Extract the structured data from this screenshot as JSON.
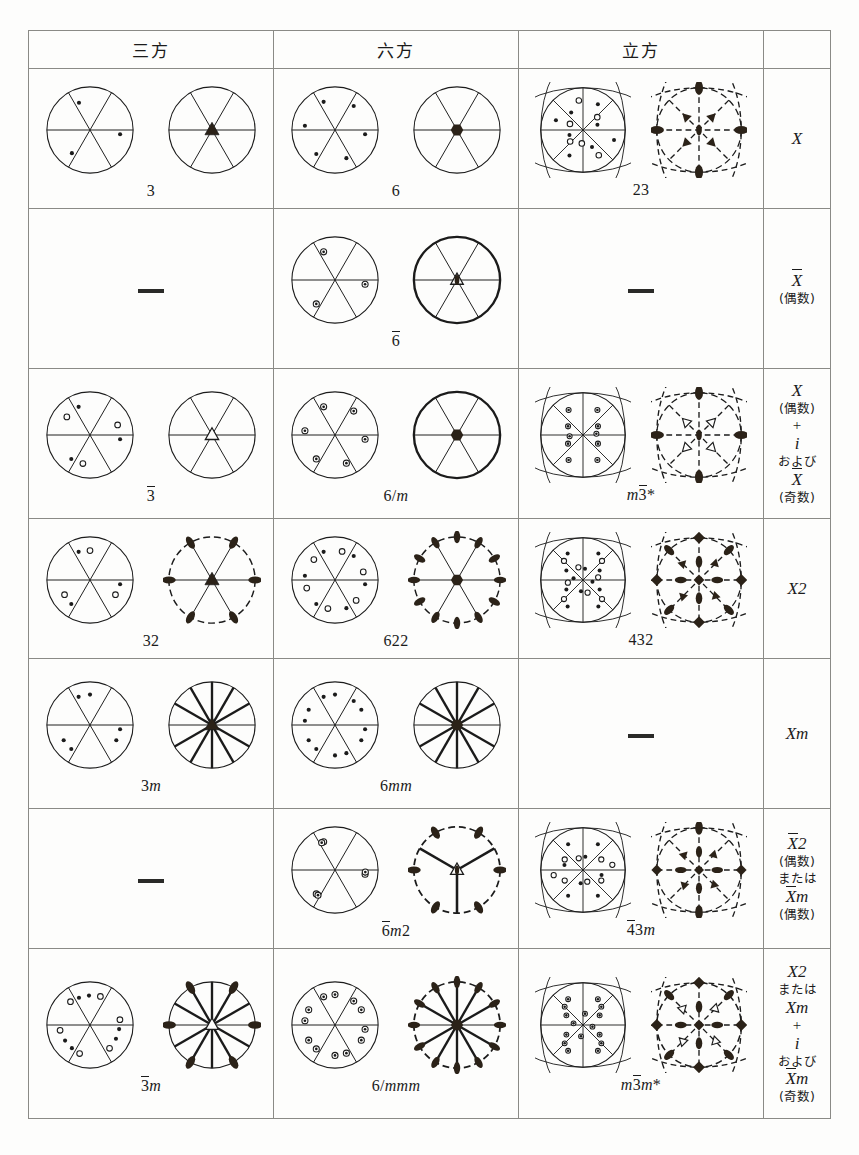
{
  "header": {
    "columns": [
      "三方",
      "六方",
      "立方",
      ""
    ],
    "column_names": [
      "trigonal",
      "hexagonal",
      "cubic",
      "general-symbol"
    ]
  },
  "rows": [
    {
      "id": "row-X",
      "trigonal": {
        "symbol": "3",
        "present": true
      },
      "hexagonal": {
        "symbol": "6",
        "present": true
      },
      "cubic": {
        "symbol": "23",
        "present": true
      },
      "label_lines": [
        {
          "text": "X",
          "style": "italic-cap"
        }
      ]
    },
    {
      "id": "row-Xbar-even",
      "trigonal": {
        "symbol": "",
        "present": false
      },
      "hexagonal": {
        "symbol": "6̄",
        "present": true
      },
      "cubic": {
        "symbol": "",
        "present": false
      },
      "label_lines": [
        {
          "text": "X",
          "style": "italic-cap-overline"
        },
        {
          "text": "(偶数)",
          "style": "jp"
        }
      ]
    },
    {
      "id": "row-X-even-plus-i",
      "trigonal": {
        "symbol": "3̄",
        "present": true
      },
      "hexagonal": {
        "symbol": "6/m",
        "present": true
      },
      "cubic": {
        "symbol": "m3̄*",
        "present": true
      },
      "label_lines": [
        {
          "text": "X",
          "style": "italic-cap"
        },
        {
          "text": "(偶数)",
          "style": "jp"
        },
        {
          "text": "+",
          "style": "op"
        },
        {
          "text": "i",
          "style": "italic"
        },
        {
          "text": "および",
          "style": "jp"
        },
        {
          "text": "X",
          "style": "italic-cap-overline"
        },
        {
          "text": "(奇数)",
          "style": "jp"
        }
      ]
    },
    {
      "id": "row-X2",
      "trigonal": {
        "symbol": "32",
        "present": true
      },
      "hexagonal": {
        "symbol": "622",
        "present": true
      },
      "cubic": {
        "symbol": "432",
        "present": true
      },
      "label_lines": [
        {
          "text": "X2",
          "style": "italic-cap"
        }
      ]
    },
    {
      "id": "row-Xm",
      "trigonal": {
        "symbol": "3m",
        "present": true
      },
      "hexagonal": {
        "symbol": "6mm",
        "present": true
      },
      "cubic": {
        "symbol": "",
        "present": false
      },
      "label_lines": [
        {
          "text": "Xm",
          "style": "italic-cap"
        }
      ]
    },
    {
      "id": "row-Xbar2-even",
      "trigonal": {
        "symbol": "",
        "present": false
      },
      "hexagonal": {
        "symbol": "6̄m2",
        "present": true
      },
      "cubic": {
        "symbol": "4̄3m",
        "present": true
      },
      "label_lines": [
        {
          "text": "X2",
          "style": "italic-cap-overline-first"
        },
        {
          "text": "(偶数)",
          "style": "jp"
        },
        {
          "text": "または",
          "style": "jp"
        },
        {
          "text": "Xm",
          "style": "italic-cap-overline-first"
        },
        {
          "text": "(偶数)",
          "style": "jp"
        }
      ]
    },
    {
      "id": "row-X2-Xm-plus-i",
      "trigonal": {
        "symbol": "3̄m",
        "present": true
      },
      "hexagonal": {
        "symbol": "6/mmm",
        "present": true
      },
      "cubic": {
        "symbol": "m3̄m*",
        "present": true
      },
      "label_lines": [
        {
          "text": "X2",
          "style": "italic-cap"
        },
        {
          "text": "または",
          "style": "jp"
        },
        {
          "text": "Xm",
          "style": "italic-cap"
        },
        {
          "text": "+",
          "style": "op"
        },
        {
          "text": "i",
          "style": "italic"
        },
        {
          "text": "および",
          "style": "jp"
        },
        {
          "text": "Xm",
          "style": "italic-cap-overline-first"
        },
        {
          "text": "(奇数)",
          "style": "jp"
        }
      ]
    }
  ],
  "placeholder_dash": "—",
  "footnote": "",
  "colors": {
    "ink": "#1b1b1b",
    "rule": "#8a8a86",
    "paper": "#fdfdfc",
    "fill": "#2b2218"
  }
}
